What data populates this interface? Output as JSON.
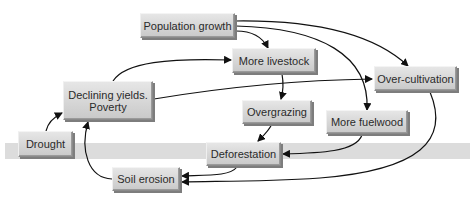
{
  "diagram": {
    "nodes": [
      {
        "id": "population_growth",
        "label": "Population growth"
      },
      {
        "id": "more_livestock",
        "label": "More livestock"
      },
      {
        "id": "over_cultivation",
        "label": "Over-cultivation"
      },
      {
        "id": "declining_yields",
        "label": "Declining yields.",
        "label2": "Poverty"
      },
      {
        "id": "overgrazing",
        "label": "Overgrazing"
      },
      {
        "id": "more_fuelwood",
        "label": "More fuelwood"
      },
      {
        "id": "drought",
        "label": "Drought"
      },
      {
        "id": "deforestation",
        "label": "Deforestation"
      },
      {
        "id": "soil_erosion",
        "label": "Soil erosion"
      }
    ],
    "edges": [
      {
        "from": "population_growth",
        "to": "more_livestock"
      },
      {
        "from": "population_growth",
        "to": "over_cultivation"
      },
      {
        "from": "population_growth",
        "to": "more_fuelwood"
      },
      {
        "from": "declining_yields",
        "to": "more_livestock"
      },
      {
        "from": "declining_yields",
        "to": "over_cultivation"
      },
      {
        "from": "more_livestock",
        "to": "overgrazing"
      },
      {
        "from": "overgrazing",
        "to": "deforestation"
      },
      {
        "from": "more_fuelwood",
        "to": "deforestation"
      },
      {
        "from": "deforestation",
        "to": "soil_erosion"
      },
      {
        "from": "over_cultivation",
        "to": "soil_erosion"
      },
      {
        "from": "soil_erosion",
        "to": "declining_yields"
      },
      {
        "from": "drought",
        "to": "declining_yields"
      }
    ],
    "colors": {
      "node_fill": "#d6d6d6",
      "band": "#dcdcdc",
      "arrow": "#111111"
    }
  }
}
